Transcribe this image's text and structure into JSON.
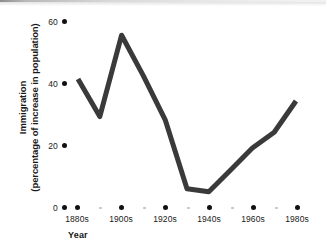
{
  "chart_data": {
    "type": "line",
    "title": "",
    "xlabel": "Year",
    "ylabel": "Immigration (percentage of increase in population)",
    "ylabel_line1": "Immigration",
    "ylabel_line2": "(percentage of increase in population)",
    "ytick_labels": [
      "60",
      "40",
      "20",
      "0"
    ],
    "ytick_values": [
      60,
      40,
      20,
      0
    ],
    "ylim": [
      0,
      60
    ],
    "xtick_labels": [
      "1880s",
      "1900s",
      "1920s",
      "1940s",
      "1960s",
      "1980s"
    ],
    "categories": [
      "1880s",
      "1890s",
      "1900s",
      "1910s",
      "1920s",
      "1930s",
      "1940s",
      "1950s",
      "1960s",
      "1970s",
      "1980s"
    ],
    "x": [
      "1880s",
      "1890s",
      "1900s",
      "1910s",
      "1920s",
      "1930s",
      "1940s",
      "1950s",
      "1960s",
      "1970s",
      "1980s"
    ],
    "values": [
      41,
      29,
      55,
      42,
      28,
      6,
      5,
      12,
      19,
      24,
      34
    ],
    "series": [
      {
        "name": "Immigration",
        "values": [
          41,
          29,
          55,
          42,
          28,
          6,
          5,
          12,
          19,
          24,
          34
        ]
      }
    ],
    "grid": false,
    "legend": false,
    "legend_position": "none",
    "line_color": "#3a3a3a",
    "line_width": 5,
    "axis_style": "dotted-ticks",
    "major_tick_color": "#111111",
    "minor_tick_color": "#c2c2c2",
    "background_color": "#ffffff",
    "text_color": "#1a1a1a",
    "annotations": []
  }
}
